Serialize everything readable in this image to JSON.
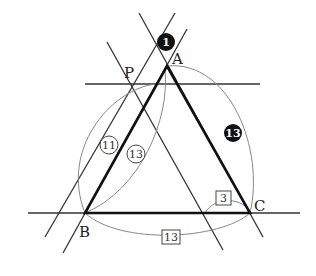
{
  "diagram": {
    "type": "geometry-construction",
    "points": {
      "A": {
        "label": "A",
        "x": 167,
        "y": 66
      },
      "B": {
        "label": "B",
        "x": 85,
        "y": 213
      },
      "C": {
        "label": "C",
        "x": 250,
        "y": 213
      },
      "P": {
        "label": "P",
        "x": 130,
        "y": 84
      }
    },
    "triangle": [
      "A",
      "B",
      "C"
    ],
    "step_labels": {
      "step1": "1",
      "arc_AC": "13",
      "arc_BP": "11",
      "arc_BA": "13",
      "arc_C": "3",
      "arc_BC": "13"
    },
    "colors": {
      "line": "#333333",
      "triangle": "#111111",
      "arc": "#888888",
      "filled_badge": "#111111"
    }
  }
}
